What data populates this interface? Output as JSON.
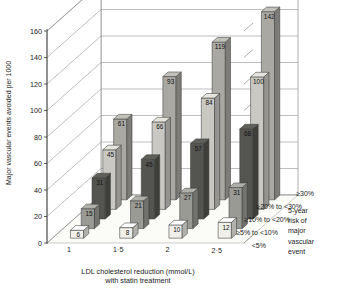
{
  "chart_data": {
    "type": "bar",
    "title": "",
    "xlabel": "LDL cholesterol reduction (mmol/L) with statin treatment",
    "ylabel": "Major vascular events avoided per 1000",
    "xlabel_line1": "LDL cholesterol reduction (mmol/L)",
    "xlabel_line2": "with statin treatment",
    "categories": [
      "1",
      "1·5",
      "2",
      "2·5"
    ],
    "ylim": [
      0,
      160
    ],
    "yticks": [
      0,
      20,
      40,
      60,
      80,
      100,
      120,
      140,
      160
    ],
    "grid": true,
    "legend_position": "right-bottom",
    "legend_title_lines": [
      "5-year",
      "risk of",
      "major",
      "vascular",
      "event"
    ],
    "series": [
      {
        "name": "<5%",
        "values": [
          6,
          8,
          10,
          12
        ],
        "color": "#f0efe9"
      },
      {
        "name": "≥5% to <10%",
        "values": [
          15,
          21,
          27,
          31
        ],
        "color": "#9a9a95"
      },
      {
        "name": "≥10% to <20%",
        "values": [
          31,
          45,
          57,
          68
        ],
        "color": "#545450"
      },
      {
        "name": "≥20% to <30%",
        "values": [
          45,
          66,
          84,
          100
        ],
        "color": "#c9c8c2"
      },
      {
        "name": "≥30%",
        "values": [
          61,
          93,
          119,
          142
        ],
        "color": "#a9a8a2"
      }
    ]
  },
  "legend": {
    "entries": [
      "≥30%",
      "≥20% to <30%",
      "≥10% to <20%",
      "≥5% to <10%",
      "<5%"
    ],
    "title": "5-year risk of major vascular event"
  }
}
